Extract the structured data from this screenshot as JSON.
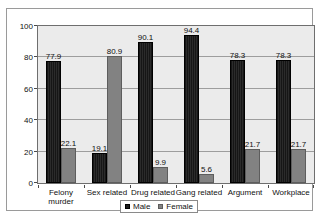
{
  "title_sliver": "",
  "chart_data": {
    "type": "bar",
    "title": "",
    "xlabel": "",
    "ylabel": "",
    "ylim": [
      0,
      100
    ],
    "yticks": [
      0,
      20,
      40,
      60,
      80,
      100
    ],
    "grid": true,
    "legend_position": "bottom",
    "categories": [
      "Felony murder",
      "Sex related",
      "Drug related",
      "Gang related",
      "Argument",
      "Workplace"
    ],
    "category_lines": [
      [
        "Felony",
        "murder"
      ],
      [
        "Sex related"
      ],
      [
        "Drug related"
      ],
      [
        "Gang related"
      ],
      [
        "Argument"
      ],
      [
        "Workplace"
      ]
    ],
    "series": [
      {
        "name": "Male",
        "color": "#1c1c1c",
        "values": [
          77.9,
          19.1,
          90.1,
          94.4,
          78.3,
          78.3
        ],
        "labels": [
          "77.9",
          "19.1",
          "90.1",
          "94.4",
          "78.3",
          "78.3"
        ]
      },
      {
        "name": "Female",
        "color": "#828282",
        "values": [
          22.1,
          80.9,
          9.9,
          5.6,
          21.7,
          21.7
        ],
        "labels": [
          "22.1",
          "80.9",
          "9.9",
          "5.6",
          "21.7",
          "21.7"
        ]
      }
    ]
  },
  "legend": {
    "entries": [
      {
        "label": "Male"
      },
      {
        "label": "Female"
      }
    ]
  },
  "colors": {
    "male": "#1c1c1c",
    "female": "#828282",
    "plot_background": "#ebebeb",
    "gridline": "#9d9d9d",
    "frame": "#9a9a9a"
  }
}
